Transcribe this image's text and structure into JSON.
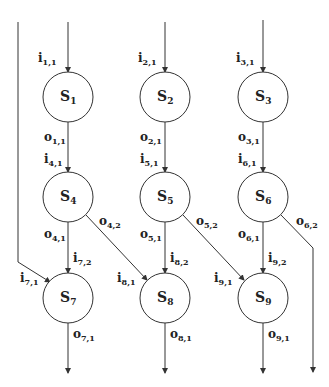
{
  "diagram": {
    "type": "dataflow-graph",
    "nodes": [
      {
        "id": "S1",
        "base": "S",
        "sub": "1"
      },
      {
        "id": "S2",
        "base": "S",
        "sub": "2"
      },
      {
        "id": "S3",
        "base": "S",
        "sub": "3"
      },
      {
        "id": "S4",
        "base": "S",
        "sub": "4"
      },
      {
        "id": "S5",
        "base": "S",
        "sub": "5"
      },
      {
        "id": "S6",
        "base": "S",
        "sub": "6"
      },
      {
        "id": "S7",
        "base": "S",
        "sub": "7"
      },
      {
        "id": "S8",
        "base": "S",
        "sub": "8"
      },
      {
        "id": "S9",
        "base": "S",
        "sub": "9"
      }
    ],
    "edges": [
      {
        "from": "input",
        "to": "S1",
        "in_label": {
          "base": "i",
          "sub": "1,1"
        }
      },
      {
        "from": "input",
        "to": "S2",
        "in_label": {
          "base": "i",
          "sub": "2,1"
        }
      },
      {
        "from": "input",
        "to": "S3",
        "in_label": {
          "base": "i",
          "sub": "3,1"
        }
      },
      {
        "from": "input",
        "to": "S7",
        "in_label": {
          "base": "i",
          "sub": "7,1"
        }
      },
      {
        "from": "S1",
        "to": "S4",
        "out_label": {
          "base": "o",
          "sub": "1,1"
        },
        "in_label": {
          "base": "i",
          "sub": "4,1"
        }
      },
      {
        "from": "S2",
        "to": "S5",
        "out_label": {
          "base": "o",
          "sub": "2,1"
        },
        "in_label": {
          "base": "i",
          "sub": "5,1"
        }
      },
      {
        "from": "S3",
        "to": "S6",
        "out_label": {
          "base": "o",
          "sub": "3,1"
        },
        "in_label": {
          "base": "i",
          "sub": "6,1"
        }
      },
      {
        "from": "S4",
        "to": "S7",
        "out_label": {
          "base": "o",
          "sub": "4,1"
        },
        "in_label": {
          "base": "i",
          "sub": "7,2"
        }
      },
      {
        "from": "S4",
        "to": "S8",
        "out_label": {
          "base": "o",
          "sub": "4,2"
        },
        "in_label": {
          "base": "i",
          "sub": "8,1"
        }
      },
      {
        "from": "S5",
        "to": "S8",
        "out_label": {
          "base": "o",
          "sub": "5,1"
        },
        "in_label": {
          "base": "i",
          "sub": "8,2"
        }
      },
      {
        "from": "S5",
        "to": "S9",
        "out_label": {
          "base": "o",
          "sub": "5,2"
        },
        "in_label": {
          "base": "i",
          "sub": "9,1"
        }
      },
      {
        "from": "S6",
        "to": "S9",
        "out_label": {
          "base": "o",
          "sub": "6,1"
        },
        "in_label": {
          "base": "i",
          "sub": "9,2"
        }
      },
      {
        "from": "S6",
        "to": "output",
        "out_label": {
          "base": "o",
          "sub": "6,2"
        }
      },
      {
        "from": "S7",
        "to": "output",
        "out_label": {
          "base": "o",
          "sub": "7,1"
        }
      },
      {
        "from": "S8",
        "to": "output",
        "out_label": {
          "base": "o",
          "sub": "8,1"
        }
      },
      {
        "from": "S9",
        "to": "output",
        "out_label": {
          "base": "o",
          "sub": "9,1"
        }
      }
    ]
  }
}
